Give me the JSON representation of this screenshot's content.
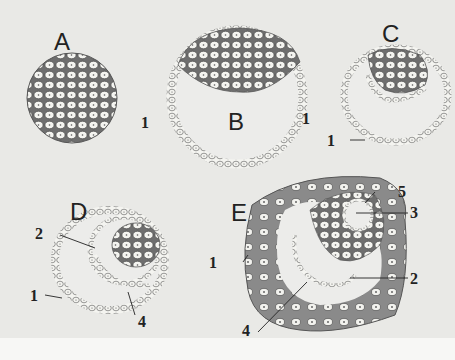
{
  "figure": {
    "panels": [
      {
        "id": "A",
        "label": "A",
        "stage": "morula",
        "callouts": [
          "1"
        ]
      },
      {
        "id": "B",
        "label": "B",
        "stage": "early blastocyst",
        "callouts": [
          "1"
        ]
      },
      {
        "id": "C",
        "label": "C",
        "stage": "blastocyst with forming hypoblast",
        "callouts": [
          "1"
        ]
      },
      {
        "id": "D",
        "label": "D",
        "stage": "bilaminar stage",
        "callouts": [
          "2",
          "1",
          "4"
        ]
      },
      {
        "id": "E",
        "label": "E",
        "stage": "implanted embryo",
        "callouts": [
          "5",
          "3",
          "1",
          "2",
          "4"
        ]
      }
    ],
    "colors": {
      "background": "#e9e9e6",
      "cell_fill": "#f4f4f0",
      "cell_outline": "#555555",
      "dark_tissue": "#6e6e6e",
      "trophoblast": "#8c8c8c"
    }
  },
  "labels": {
    "A": "A",
    "B": "B",
    "C": "C",
    "D": "D",
    "E": "E",
    "A1": "1",
    "B1": "1",
    "C1": "1",
    "D2": "2",
    "D1": "1",
    "D4": "4",
    "E5": "5",
    "E3": "3",
    "E1": "1",
    "E2": "2",
    "E4": "4"
  }
}
